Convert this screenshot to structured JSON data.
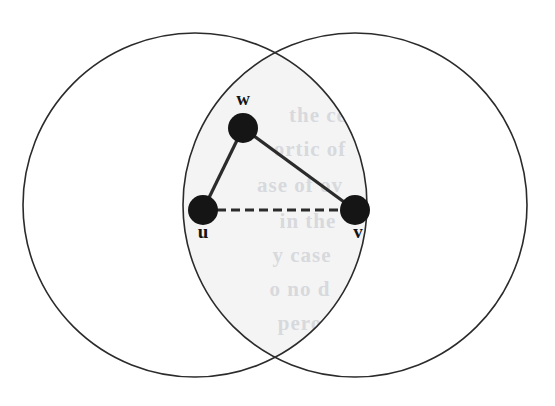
{
  "figure": {
    "kind": "venn-diagram-with-graph",
    "caption": "",
    "background_color": "#ffffff",
    "stroke_color": "#2b2b2b",
    "lens_fill_color": "#f4f4f4",
    "node_fill_color": "#151515",
    "canvas": {
      "width": 555,
      "height": 406
    }
  },
  "circles": [
    {
      "id": "left-circle",
      "label": "",
      "cx": 195,
      "cy": 205,
      "r": 172,
      "stroke": "#2b2b2b",
      "stroke_width": 1.6,
      "fill": "none"
    },
    {
      "id": "right-circle",
      "label": "",
      "cx": 355,
      "cy": 205,
      "r": 172,
      "stroke": "#2b2b2b",
      "stroke_width": 1.6,
      "fill": "none"
    }
  ],
  "lens": {
    "id": "intersection-lens",
    "fill": "#f4f4f4",
    "top_point": {
      "x": 275,
      "y": 49
    },
    "bottom_point": {
      "x": 275,
      "y": 361
    }
  },
  "nodes": [
    {
      "id": "w",
      "label": "w",
      "cx": 243,
      "cy": 128,
      "r": 15,
      "label_x": 243,
      "label_y": 101,
      "label_position": "above"
    },
    {
      "id": "u",
      "label": "u",
      "cx": 203,
      "cy": 210,
      "r": 15,
      "label_x": 203,
      "label_y": 234,
      "label_position": "below"
    },
    {
      "id": "v",
      "label": "v",
      "cx": 355,
      "cy": 210,
      "r": 15,
      "label_x": 358,
      "label_y": 234,
      "label_position": "below"
    }
  ],
  "edges": [
    {
      "id": "edge-u-w",
      "from": "u",
      "to": "w",
      "style": "solid",
      "stroke_width": 3.2
    },
    {
      "id": "edge-w-v",
      "from": "w",
      "to": "v",
      "style": "solid",
      "stroke_width": 3.2
    },
    {
      "id": "edge-u-v",
      "from": "u",
      "to": "v",
      "style": "dashed",
      "stroke_width": 3.2,
      "dash_pattern": "9 5"
    }
  ],
  "ghost_text": {
    "description": "faint show-through text from the reverse page of the scan",
    "color": "#b9bdc6",
    "lines": [
      {
        "text": "the ce",
        "x": 318,
        "y": 122,
        "size": 21
      },
      {
        "text": "ortic of",
        "x": 310,
        "y": 156,
        "size": 21
      },
      {
        "text": "ase of ov",
        "x": 300,
        "y": 192,
        "size": 21
      },
      {
        "text": "in the",
        "x": 308,
        "y": 228,
        "size": 21
      },
      {
        "text": "y case",
        "x": 302,
        "y": 262,
        "size": 21
      },
      {
        "text": "o no d",
        "x": 300,
        "y": 296,
        "size": 21
      },
      {
        "text": "pero",
        "x": 300,
        "y": 330,
        "size": 21
      }
    ]
  }
}
